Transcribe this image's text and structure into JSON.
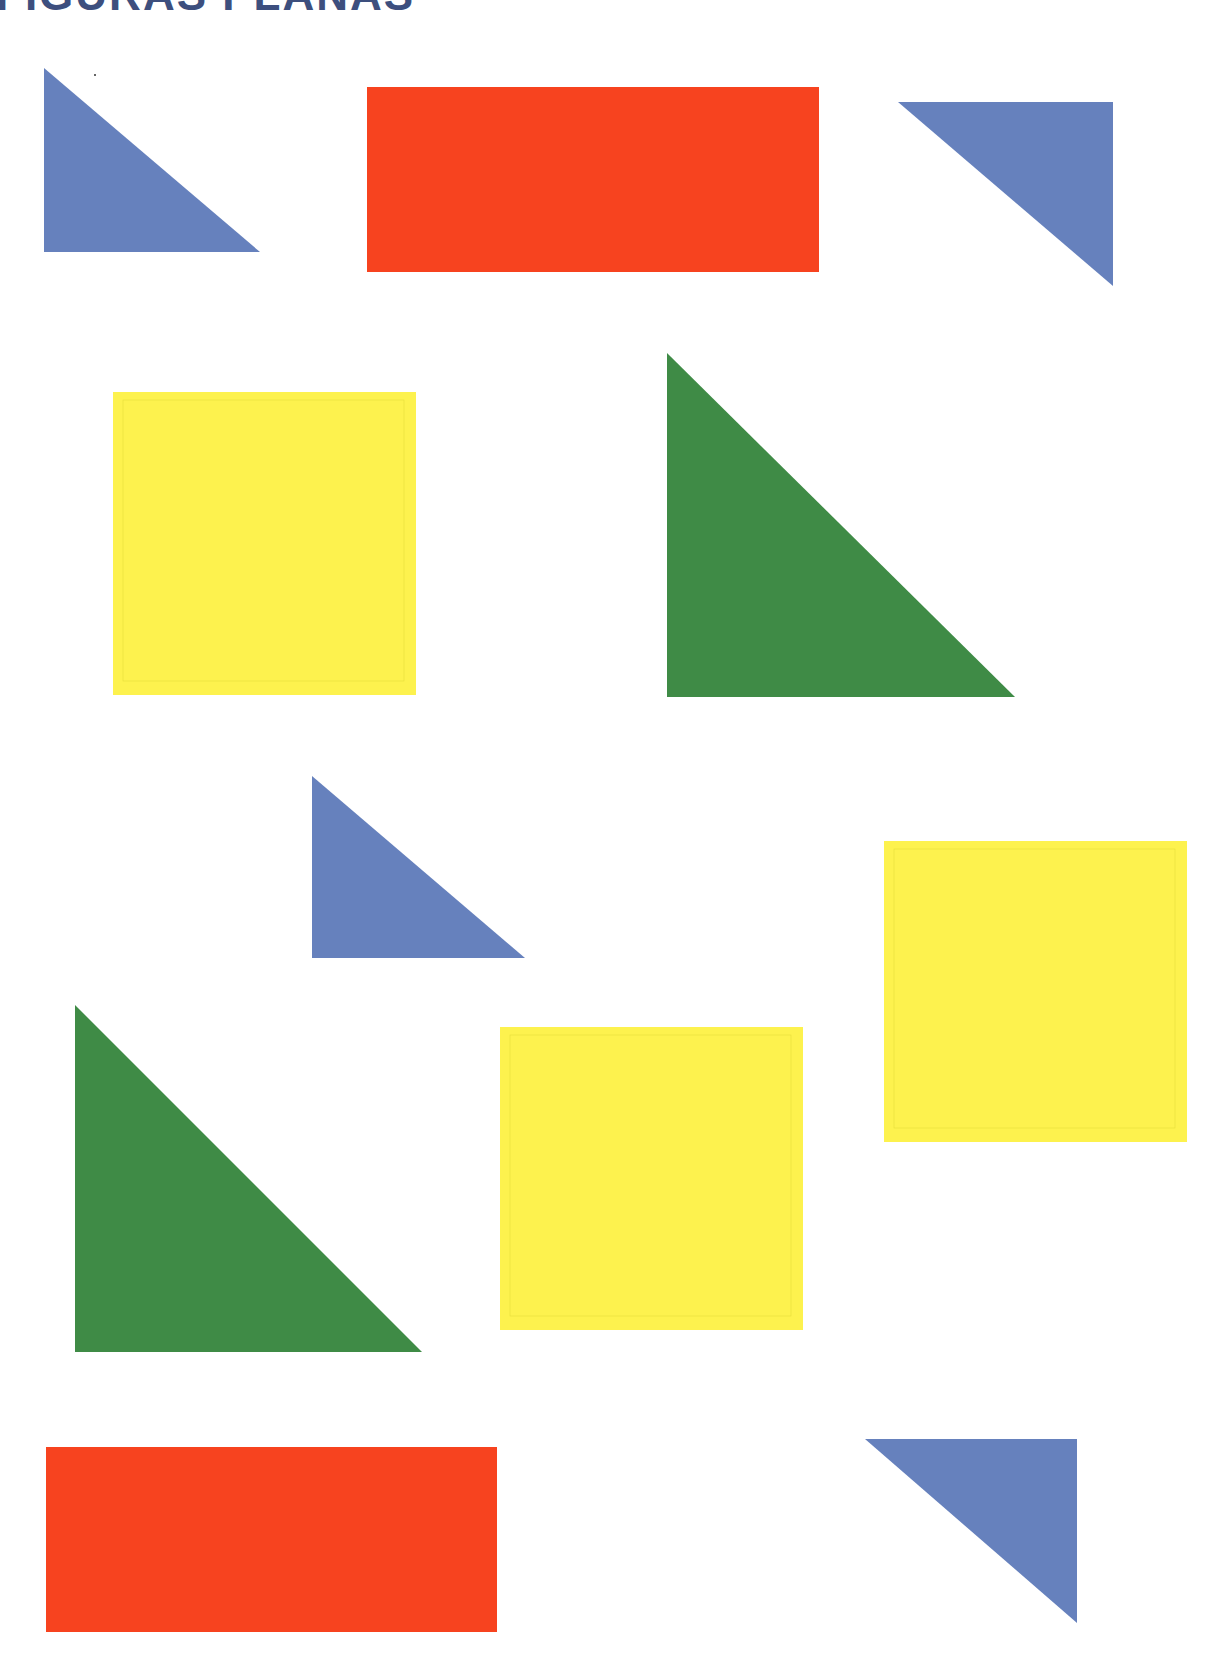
{
  "page": {
    "title": "FIGURAS PLANAS"
  },
  "colors": {
    "blue": "#6681bd",
    "red": "#f7431f",
    "yellow": "#fdf24e",
    "green": "#3f8b46",
    "yellow_inner_line": "#e6dc3c",
    "title": "#3d4f7e"
  },
  "shapes": [
    {
      "id": "blue-triangle-1",
      "type": "right-triangle",
      "color": "blue",
      "points": "44,68 44,252 260,252"
    },
    {
      "id": "red-rectangle-1",
      "type": "rectangle",
      "color": "red",
      "x": 367,
      "y": 87,
      "w": 452,
      "h": 185
    },
    {
      "id": "blue-triangle-2",
      "type": "right-triangle",
      "color": "blue",
      "points": "898,102 1113,102 1113,286"
    },
    {
      "id": "yellow-square-1",
      "type": "square",
      "color": "yellow",
      "x": 113,
      "y": 392,
      "w": 303,
      "h": 303
    },
    {
      "id": "green-triangle-1",
      "type": "right-triangle",
      "color": "green",
      "points": "667,353 667,697 1015,697"
    },
    {
      "id": "blue-triangle-3",
      "type": "right-triangle",
      "color": "blue",
      "points": "312,776 312,958 525,958"
    },
    {
      "id": "yellow-square-2",
      "type": "square",
      "color": "yellow",
      "x": 884,
      "y": 841,
      "w": 303,
      "h": 301
    },
    {
      "id": "green-triangle-2",
      "type": "right-triangle",
      "color": "green",
      "points": "75,1005 75,1352 422,1352"
    },
    {
      "id": "yellow-square-3",
      "type": "square",
      "color": "yellow",
      "x": 500,
      "y": 1027,
      "w": 303,
      "h": 303
    },
    {
      "id": "red-rectangle-2",
      "type": "rectangle",
      "color": "red",
      "x": 46,
      "y": 1447,
      "w": 451,
      "h": 185
    },
    {
      "id": "blue-triangle-4",
      "type": "right-triangle",
      "color": "blue",
      "points": "865,1439 1077,1439 1077,1623"
    }
  ]
}
